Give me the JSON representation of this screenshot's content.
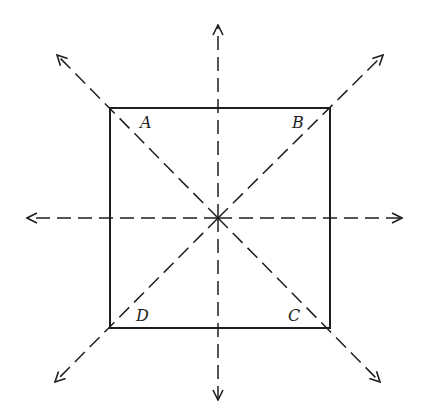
{
  "diagram": {
    "colors": {
      "stroke": "#1e1e1e",
      "background": "#ffffff"
    },
    "square": {
      "x1": 110,
      "y1": 108,
      "x2": 330,
      "y2": 328
    },
    "center": {
      "x": 218,
      "y": 218
    },
    "vertices": [
      {
        "id": "A",
        "label": "A",
        "x": 140,
        "y": 115
      },
      {
        "id": "B",
        "label": "B",
        "x": 292,
        "y": 115
      },
      {
        "id": "C",
        "label": "C",
        "x": 288,
        "y": 308
      },
      {
        "id": "D",
        "label": "D",
        "x": 136,
        "y": 308
      }
    ],
    "axes": [
      {
        "name": "vertical-axis",
        "from": [
          218,
          398
        ],
        "to": [
          218,
          25
        ]
      },
      {
        "name": "vertical-axis-down",
        "from": [
          218,
          218
        ],
        "to": [
          218,
          400
        ]
      },
      {
        "name": "horizontal-axis-left",
        "from": [
          218,
          218
        ],
        "to": [
          27,
          218
        ]
      },
      {
        "name": "horizontal-axis-right",
        "from": [
          218,
          218
        ],
        "to": [
          402,
          218
        ]
      },
      {
        "name": "diagonal-axis-upper-left",
        "from": [
          218,
          218
        ],
        "to": [
          57,
          55
        ]
      },
      {
        "name": "diagonal-axis-lower-right",
        "from": [
          218,
          218
        ],
        "to": [
          380,
          382
        ]
      },
      {
        "name": "diagonal-axis-upper-right",
        "from": [
          218,
          218
        ],
        "to": [
          383,
          55
        ]
      },
      {
        "name": "diagonal-axis-lower-left",
        "from": [
          218,
          218
        ],
        "to": [
          55,
          382
        ]
      }
    ]
  }
}
